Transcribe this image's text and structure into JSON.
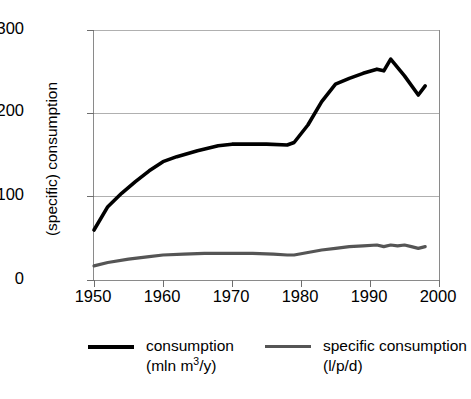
{
  "chart_data": {
    "type": "line",
    "title": "",
    "xlabel": "",
    "ylabel": "(specific) consumption",
    "xlim": [
      1950,
      2000
    ],
    "ylim": [
      0,
      300
    ],
    "xticks": [
      1950,
      1960,
      1970,
      1980,
      1990,
      2000
    ],
    "yticks": [
      0,
      100,
      200,
      300
    ],
    "grid": "horizontal",
    "legend_position": "bottom",
    "series": [
      {
        "name": "consumption",
        "units": "(mln m3/y)",
        "color": "#000000",
        "x": [
          1950,
          1952,
          1954,
          1956,
          1958,
          1960,
          1962,
          1965,
          1968,
          1970,
          1972,
          1975,
          1978,
          1979,
          1981,
          1983,
          1985,
          1987,
          1989,
          1991,
          1992,
          1993,
          1995,
          1997,
          1998
        ],
        "values": [
          60,
          88,
          104,
          118,
          131,
          142,
          148,
          155,
          161,
          163,
          163,
          163,
          162,
          165,
          186,
          214,
          235,
          242,
          248,
          253,
          251,
          265,
          245,
          222,
          233
        ]
      },
      {
        "name": "specific consumption",
        "units": "(l/p/d)",
        "color": "#555555",
        "x": [
          1950,
          1952,
          1955,
          1958,
          1960,
          1963,
          1966,
          1970,
          1973,
          1976,
          1978,
          1979,
          1981,
          1983,
          1985,
          1987,
          1989,
          1991,
          1992,
          1993,
          1994,
          1995,
          1996,
          1997,
          1998
        ],
        "values": [
          17,
          21,
          25,
          28,
          30,
          31,
          32,
          32,
          32,
          31,
          30,
          30,
          33,
          36,
          38,
          40,
          41,
          42,
          40,
          42,
          41,
          42,
          40,
          38,
          40
        ]
      }
    ]
  },
  "yaxis": {
    "label": "(specific) consumption",
    "ticklabels": [
      "0",
      "100",
      "200",
      "300"
    ]
  },
  "xaxis": {
    "ticklabels": [
      "1950",
      "1960",
      "1970",
      "1980",
      "1990",
      "2000"
    ]
  },
  "legend": {
    "entries": [
      {
        "name_line1": "consumption",
        "name_line2_pre": "(mln m",
        "name_line2_sup": "3",
        "name_line2_post": "/y)",
        "color": "#000000"
      },
      {
        "name_line1": "specific consumption",
        "name_line2_pre": "(l/p/d)",
        "name_line2_sup": "",
        "name_line2_post": "",
        "color": "#555555"
      }
    ]
  }
}
